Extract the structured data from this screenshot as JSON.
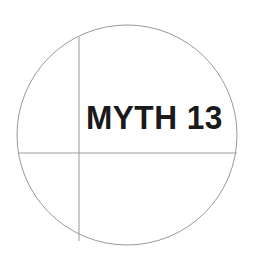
{
  "canvas": {
    "width": 256,
    "height": 270,
    "background_color": "#ffffff"
  },
  "figure": {
    "type": "circle-with-crosshair-diagram",
    "stroke_color": "#9a9a9a",
    "stroke_width": 1,
    "circle": {
      "center_x": 127,
      "center_y": 135,
      "radius": 110
    },
    "vertical_line": {
      "x": 79,
      "y_start": 37,
      "y_end": 241
    },
    "horizontal_line": {
      "y": 153,
      "x_start": 18,
      "x_end": 237
    }
  },
  "label": {
    "text": "MYTH 13",
    "color": "#1a1a1a",
    "x": 88,
    "y": 104
  }
}
